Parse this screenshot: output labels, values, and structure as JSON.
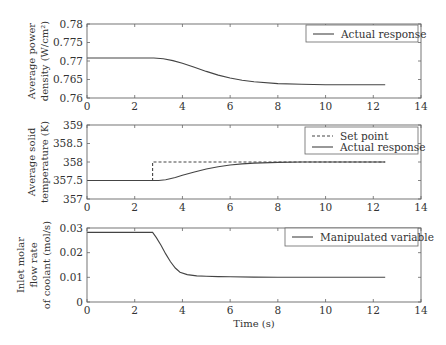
{
  "chart_data": [
    {
      "type": "line",
      "title": "",
      "xlabel": "",
      "ylabel": "Average power density (W/cm²)",
      "ylabel_lines": [
        "Average power",
        "density (W/cm²)"
      ],
      "xlim": [
        0,
        14
      ],
      "ylim": [
        0.76,
        0.78
      ],
      "xticks": [
        "0",
        "2",
        "4",
        "6",
        "8",
        "10",
        "12",
        "14"
      ],
      "yticks": [
        "0.76",
        "0.765",
        "0.77",
        "0.775",
        "0.78"
      ],
      "grid": false,
      "legend_position": "upper right",
      "series": [
        {
          "name": "Actual response",
          "style": "solid",
          "x": [
            0,
            2.8,
            3.2,
            3.6,
            4.0,
            4.5,
            5.0,
            5.5,
            6.0,
            6.5,
            7.0,
            8.0,
            9.0,
            10.0,
            11.0,
            12.5
          ],
          "y": [
            0.7708,
            0.7708,
            0.7706,
            0.7701,
            0.7694,
            0.7683,
            0.7672,
            0.7662,
            0.7654,
            0.7648,
            0.7644,
            0.7639,
            0.7637,
            0.7636,
            0.7636,
            0.7636
          ]
        }
      ]
    },
    {
      "type": "line",
      "title": "",
      "xlabel": "",
      "ylabel": "Average solid temperature (K)",
      "ylabel_lines": [
        "Average solid",
        "temperature (K)"
      ],
      "xlim": [
        0,
        14
      ],
      "ylim": [
        357,
        359
      ],
      "xticks": [
        "0",
        "2",
        "4",
        "6",
        "8",
        "10",
        "12",
        "14"
      ],
      "yticks": [
        "357",
        "357.5",
        "358",
        "358.5",
        "359"
      ],
      "grid": false,
      "legend_position": "upper right",
      "series": [
        {
          "name": "Set point",
          "style": "dashed",
          "x": [
            0,
            2.75,
            2.75,
            12.5
          ],
          "y": [
            357.5,
            357.5,
            358.0,
            358.0
          ]
        },
        {
          "name": "Actual response",
          "style": "solid",
          "x": [
            0,
            3.0,
            3.3,
            3.7,
            4.0,
            4.5,
            5.0,
            5.5,
            6.0,
            6.5,
            7.0,
            8.0,
            9.0,
            10.0,
            12.5
          ],
          "y": [
            357.5,
            357.5,
            357.52,
            357.58,
            357.64,
            357.73,
            357.81,
            357.87,
            357.92,
            357.95,
            357.97,
            357.99,
            358.0,
            358.0,
            358.0
          ]
        }
      ]
    },
    {
      "type": "line",
      "title": "",
      "xlabel": "Time (s)",
      "ylabel": "Inlet molar flow rate of coolant (mol/s)",
      "ylabel_lines": [
        "Inlet molar",
        "flow rate",
        "of coolant (mol/s)"
      ],
      "xlim": [
        0,
        14
      ],
      "ylim": [
        0,
        0.03
      ],
      "xticks": [
        "0",
        "2",
        "4",
        "6",
        "8",
        "10",
        "12",
        "14"
      ],
      "yticks": [
        "0",
        "0.01",
        "0.02",
        "0.03"
      ],
      "grid": false,
      "legend_position": "upper right",
      "series": [
        {
          "name": "Manipulated variable",
          "style": "solid",
          "x": [
            0,
            2.75,
            2.9,
            3.1,
            3.3,
            3.5,
            3.7,
            3.9,
            4.2,
            4.6,
            5.0,
            5.5,
            6.0,
            7.0,
            8.0,
            10.0,
            12.5
          ],
          "y": [
            0.0282,
            0.0282,
            0.0262,
            0.023,
            0.0195,
            0.0163,
            0.0138,
            0.0121,
            0.0111,
            0.0106,
            0.0104,
            0.0103,
            0.0102,
            0.0101,
            0.01,
            0.01,
            0.01
          ]
        }
      ]
    }
  ]
}
